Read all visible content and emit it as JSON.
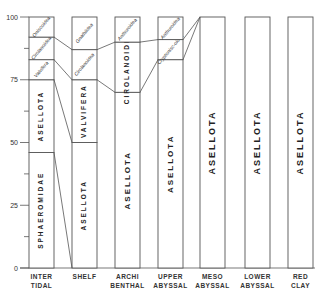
{
  "chart_data": {
    "type": "bar",
    "subtype": "stacked-100-percent",
    "title": "",
    "xlabel": "",
    "ylabel": "",
    "ylim": [
      0,
      100
    ],
    "y_ticks": [
      "0",
      "25",
      "50",
      "75",
      "100"
    ],
    "categories": [
      "INTER TIDAL",
      "SHELF",
      "ARCHI BENTHAL",
      "UPPER ABYSSAL",
      "MESO ABYSSAL",
      "LOWER ABYSSAL",
      "RED CLAY"
    ],
    "columns": [
      {
        "zone": "INTER TIDAL",
        "line1": "INTER",
        "line2": "TIDAL",
        "segments": [
          {
            "name": "SPHAEROMIDAE",
            "from": 0,
            "to": 46
          },
          {
            "name": "ASELLOTA",
            "from": 46,
            "to": 75
          },
          {
            "name": "Valvifera",
            "from": 75,
            "to": 83
          },
          {
            "name": "Cirolanoidea",
            "from": 83,
            "to": 92
          },
          {
            "name": "Oniscoidea",
            "from": 92,
            "to": 100
          }
        ]
      },
      {
        "zone": "SHELF",
        "line1": "SHELF",
        "line2": "",
        "segments": [
          {
            "name": "ASELLOTA",
            "from": 0,
            "to": 50
          },
          {
            "name": "VALVIFERA",
            "from": 50,
            "to": 75
          },
          {
            "name": "Cirolanoidea",
            "from": 75,
            "to": 87
          },
          {
            "name": "Gnathiidea",
            "from": 87,
            "to": 100
          }
        ]
      },
      {
        "zone": "ARCHI BENTHAL",
        "line1": "ARCHI",
        "line2": "BENTHAL",
        "segments": [
          {
            "name": "ASELLOTA",
            "from": 0,
            "to": 70
          },
          {
            "name": "CIROLANOIDEA",
            "from": 70,
            "to": 90
          },
          {
            "name": "Anthuroidea",
            "from": 90,
            "to": 100
          }
        ]
      },
      {
        "zone": "UPPER ABYSSAL",
        "line1": "UPPER",
        "line2": "ABYSSAL",
        "segments": [
          {
            "name": "ASELLOTA",
            "from": 0,
            "to": 83
          },
          {
            "name": "Cryptonisc-oidea",
            "from": 83,
            "to": 91
          },
          {
            "name": "Anthuroidea",
            "from": 91,
            "to": 100
          }
        ]
      },
      {
        "zone": "MESO ABYSSAL",
        "line1": "MESO",
        "line2": "ABYSSAL",
        "segments": [
          {
            "name": "ASELLOTA",
            "from": 0,
            "to": 100
          }
        ]
      },
      {
        "zone": "LOWER ABYSSAL",
        "line1": "LOWER",
        "line2": "ABYSSAL",
        "segments": [
          {
            "name": "ASELLOTA",
            "from": 0,
            "to": 100
          }
        ]
      },
      {
        "zone": "RED CLAY",
        "line1": "RED",
        "line2": "CLAY",
        "segments": [
          {
            "name": "ASELLOTA",
            "from": 0,
            "to": 100
          }
        ]
      }
    ],
    "grid": false,
    "legend": "none (labels inside segments)"
  }
}
